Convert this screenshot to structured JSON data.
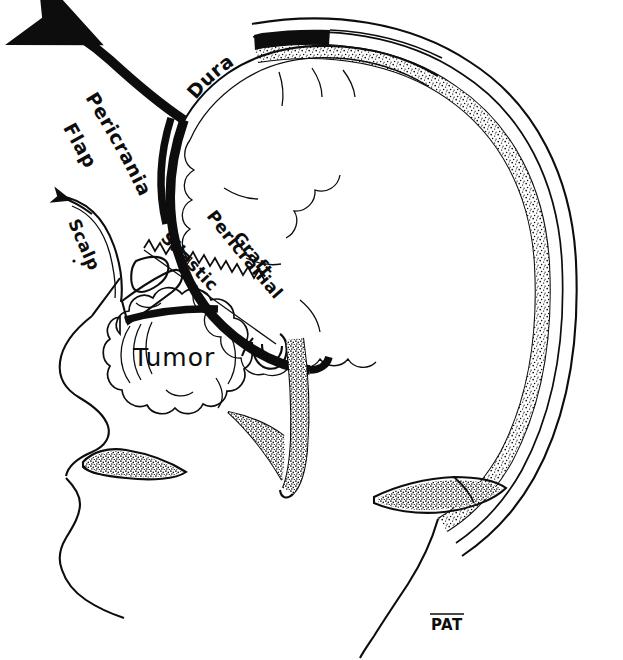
{
  "figure": {
    "medium": "pen-and-ink line drawing",
    "view": "lateral sagittal cross-section of head",
    "background_color": "#ffffff",
    "ink_color": "#0d0d0d"
  },
  "labels": {
    "pericranial_flap": "Pericranial Flap",
    "pericranial_flap_line1": "Pericranial",
    "pericranial_flap_line2": "Flap",
    "scalp": "Scalp",
    "dura": "Dura",
    "silastic": "Silastic",
    "pericranial_graft": "Pericranial Graft",
    "pericranial_graft_line1": "Pericranial",
    "pericranial_graft_line2": "Graft",
    "tumor": "Tumor"
  },
  "signature": {
    "text": "PAT",
    "has_overline": true
  },
  "anatomy": [
    {
      "name": "scalp-layer",
      "label": "Scalp"
    },
    {
      "name": "galea-layer",
      "label": "Galea"
    },
    {
      "name": "skull-bone-diploe",
      "label": "Skull bone (stippled diploe)"
    },
    {
      "name": "dura-layer",
      "label": "Dura"
    },
    {
      "name": "brain-frontal-lobe",
      "label": "Brain (frontal lobe, gyri)"
    },
    {
      "name": "tumor-mass",
      "label": "Tumor"
    },
    {
      "name": "hard-palate",
      "label": "Hard palate"
    },
    {
      "name": "sphenoid-clivus",
      "label": "Sphenoid / clivus"
    },
    {
      "name": "occipital-bone",
      "label": "Occipital bone"
    },
    {
      "name": "facial-profile",
      "label": "Facial profile (nose, lips, chin)"
    }
  ],
  "annotations": {
    "flap_arrow_direction": "up-left",
    "scalp_arrow_direction": "up-left",
    "silastic_marking": "zigzag hatched line",
    "bone_cut_edge": "solid black block at frontal craniotomy"
  }
}
